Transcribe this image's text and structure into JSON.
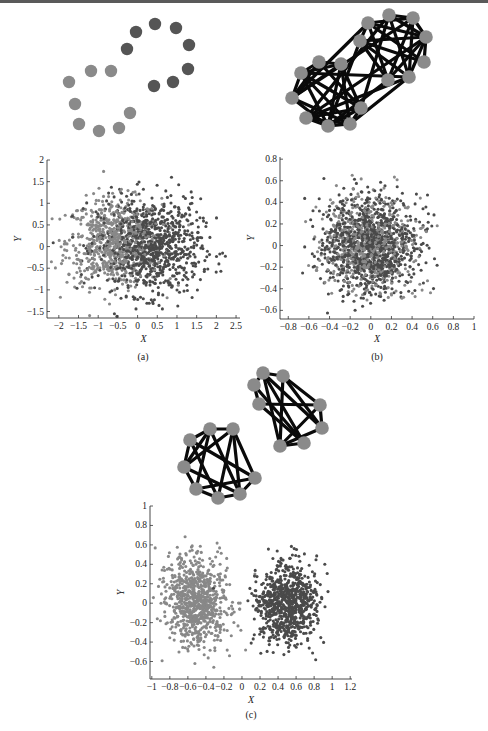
{
  "figure": {
    "panels": [
      {
        "id": "a",
        "caption": "(a)"
      },
      {
        "id": "b",
        "caption": "(b)"
      },
      {
        "id": "c",
        "caption": "(c)"
      }
    ]
  },
  "colors": {
    "light_node": "#8a8a8a",
    "dark_node": "#555555",
    "edge": "#0a0a0a",
    "light_point": "#888888",
    "dark_point": "#4a4a4a",
    "axis": "#333333",
    "top_rule": "#5a5a5a"
  },
  "graphs": [
    {
      "id": "a-graph",
      "description": "Ring of 16 nodes, two colored halves, no edges",
      "nodes": [
        {
          "x": 69,
          "y": 82,
          "c": "light"
        },
        {
          "x": 75,
          "y": 104,
          "c": "light"
        },
        {
          "x": 91,
          "y": 71,
          "c": "light"
        },
        {
          "x": 111,
          "y": 71,
          "c": "light"
        },
        {
          "x": 79,
          "y": 124,
          "c": "light"
        },
        {
          "x": 99,
          "y": 131,
          "c": "light"
        },
        {
          "x": 119,
          "y": 128,
          "c": "light"
        },
        {
          "x": 130,
          "y": 113,
          "c": "light"
        },
        {
          "x": 127,
          "y": 49,
          "c": "dark"
        },
        {
          "x": 136,
          "y": 32,
          "c": "dark"
        },
        {
          "x": 155,
          "y": 24,
          "c": "dark"
        },
        {
          "x": 176,
          "y": 28,
          "c": "dark"
        },
        {
          "x": 189,
          "y": 45,
          "c": "dark"
        },
        {
          "x": 188,
          "y": 69,
          "c": "dark"
        },
        {
          "x": 173,
          "y": 82,
          "c": "dark"
        },
        {
          "x": 154,
          "y": 86,
          "c": "dark"
        }
      ],
      "edges": []
    },
    {
      "id": "b-graph",
      "description": "Two dense communities connected by many edges",
      "nodes": [
        {
          "x": 301,
          "y": 73
        },
        {
          "x": 319,
          "y": 62
        },
        {
          "x": 341,
          "y": 64
        },
        {
          "x": 292,
          "y": 98
        },
        {
          "x": 306,
          "y": 118
        },
        {
          "x": 328,
          "y": 126
        },
        {
          "x": 350,
          "y": 124
        },
        {
          "x": 361,
          "y": 108
        },
        {
          "x": 360,
          "y": 41
        },
        {
          "x": 368,
          "y": 23
        },
        {
          "x": 389,
          "y": 15
        },
        {
          "x": 413,
          "y": 18
        },
        {
          "x": 426,
          "y": 37
        },
        {
          "x": 424,
          "y": 62
        },
        {
          "x": 409,
          "y": 77
        },
        {
          "x": 388,
          "y": 80
        }
      ],
      "edge_pattern": "dense"
    },
    {
      "id": "c-graph",
      "description": "Two separate communities of 8 nodes each",
      "nodes": [
        {
          "x": 190,
          "y": 440
        },
        {
          "x": 210,
          "y": 429
        },
        {
          "x": 233,
          "y": 429
        },
        {
          "x": 184,
          "y": 467
        },
        {
          "x": 196,
          "y": 489
        },
        {
          "x": 218,
          "y": 498
        },
        {
          "x": 240,
          "y": 494
        },
        {
          "x": 255,
          "y": 478
        },
        {
          "x": 254,
          "y": 385
        },
        {
          "x": 263,
          "y": 373
        },
        {
          "x": 283,
          "y": 376
        },
        {
          "x": 259,
          "y": 404
        },
        {
          "x": 320,
          "y": 405
        },
        {
          "x": 322,
          "y": 428
        },
        {
          "x": 304,
          "y": 443
        },
        {
          "x": 280,
          "y": 446
        }
      ],
      "edges": [
        [
          0,
          1
        ],
        [
          0,
          3
        ],
        [
          0,
          5
        ],
        [
          0,
          7
        ],
        [
          1,
          2
        ],
        [
          1,
          4
        ],
        [
          1,
          6
        ],
        [
          2,
          3
        ],
        [
          2,
          5
        ],
        [
          2,
          7
        ],
        [
          3,
          6
        ],
        [
          4,
          5
        ],
        [
          4,
          7
        ],
        [
          5,
          6
        ],
        [
          3,
          4
        ],
        [
          6,
          7
        ],
        [
          1,
          3
        ],
        [
          2,
          6
        ],
        [
          8,
          9
        ],
        [
          8,
          11
        ],
        [
          9,
          10
        ],
        [
          9,
          13
        ],
        [
          9,
          14
        ],
        [
          10,
          12
        ],
        [
          10,
          15
        ],
        [
          11,
          14
        ],
        [
          11,
          12
        ],
        [
          12,
          15
        ],
        [
          13,
          15
        ],
        [
          8,
          14
        ],
        [
          10,
          13
        ],
        [
          12,
          13
        ],
        [
          14,
          15
        ],
        [
          9,
          15
        ]
      ]
    }
  ],
  "chart_data": [
    {
      "type": "scatter",
      "panel": "(a)",
      "title": "",
      "xlabel": "X",
      "ylabel": "Y",
      "xlim": [
        -2.3,
        2.6
      ],
      "ylim": [
        -1.65,
        2.0
      ],
      "xticks": [
        "-2",
        "-1.5",
        "-1",
        "-0.5",
        "0",
        "0.5",
        "1",
        "1.5",
        "2",
        "2.5"
      ],
      "xtick_values": [
        -2,
        -1.5,
        -1,
        -0.5,
        0,
        0.5,
        1,
        1.5,
        2,
        2.5
      ],
      "yticks": [
        "-1.5",
        "-1",
        "-0.5",
        "0",
        "0.5",
        "1",
        "1.5",
        "2"
      ],
      "ytick_values": [
        -1.5,
        -1,
        -0.5,
        0,
        0.5,
        1,
        1.5,
        2
      ],
      "grid": false,
      "legend": null,
      "series": [
        {
          "name": "community 1 (light)",
          "cx": -0.6,
          "cy": 0.1,
          "sx": 0.6,
          "sy": 0.5,
          "n": 700
        },
        {
          "name": "community 2 (dark)",
          "cx": 0.3,
          "cy": 0.0,
          "sx": 0.65,
          "sy": 0.55,
          "n": 900
        }
      ]
    },
    {
      "type": "scatter",
      "panel": "(b)",
      "title": "",
      "xlabel": "X",
      "ylabel": "Y",
      "xlim": [
        -0.88,
        1.0
      ],
      "ylim": [
        -0.68,
        0.82
      ],
      "xticks": [
        "-0.8",
        "-0.6",
        "-0.4",
        "-0.2",
        "0",
        "0.2",
        "0.4",
        "0.6",
        "0.8",
        "1"
      ],
      "xtick_values": [
        -0.8,
        -0.6,
        -0.4,
        -0.2,
        0,
        0.2,
        0.4,
        0.6,
        0.8,
        1
      ],
      "yticks": [
        "-0.6",
        "-0.4",
        "-0.2",
        "0",
        "0.2",
        "0.4",
        "0.6",
        "0.8"
      ],
      "ytick_values": [
        -0.6,
        -0.4,
        -0.2,
        0,
        0.2,
        0.4,
        0.6,
        0.8
      ],
      "grid": false,
      "legend": null,
      "series": [
        {
          "name": "community 1 (light)",
          "cx": -0.02,
          "cy": 0.02,
          "sx": 0.22,
          "sy": 0.22,
          "n": 600
        },
        {
          "name": "community 2 (dark)",
          "cx": 0.0,
          "cy": 0.0,
          "sx": 0.22,
          "sy": 0.22,
          "n": 1000
        }
      ]
    },
    {
      "type": "scatter",
      "panel": "(c)",
      "title": "",
      "xlabel": "X",
      "ylabel": "Y",
      "xlim": [
        -1.02,
        1.22
      ],
      "ylim": [
        -0.78,
        1.0
      ],
      "xticks": [
        "-1",
        "-0.8",
        "-0.6",
        "-0.4",
        "-0.2",
        "0",
        "0.2",
        "0.4",
        "0.6",
        "0.8",
        "1",
        "1.2"
      ],
      "xtick_values": [
        -1,
        -0.8,
        -0.6,
        -0.4,
        -0.2,
        0,
        0.2,
        0.4,
        0.6,
        0.8,
        1,
        1.2
      ],
      "yticks": [
        "-0.6",
        "-0.4",
        "-0.2",
        "0",
        "0.2",
        "0.4",
        "0.6",
        "0.8",
        "1"
      ],
      "ytick_values": [
        -0.6,
        -0.4,
        -0.2,
        0,
        0.2,
        0.4,
        0.6,
        0.8,
        1
      ],
      "grid": false,
      "legend": null,
      "series": [
        {
          "name": "community 1 (light)",
          "cx": -0.5,
          "cy": 0.02,
          "sx": 0.17,
          "sy": 0.22,
          "n": 800
        },
        {
          "name": "community 2 (dark)",
          "cx": 0.5,
          "cy": 0.0,
          "sx": 0.17,
          "sy": 0.2,
          "n": 800
        }
      ]
    }
  ],
  "plots": [
    {
      "box": {
        "x": 47,
        "y": 160,
        "w": 193,
        "h": 158
      },
      "xlabel_y": 342,
      "caption_y": 360
    },
    {
      "box": {
        "x": 280,
        "y": 157,
        "w": 194,
        "h": 162
      },
      "xlabel_y": 342,
      "caption_y": 360
    },
    {
      "box": {
        "x": 150,
        "y": 506,
        "w": 202,
        "h": 173
      },
      "xlabel_y": 703,
      "caption_y": 718
    }
  ]
}
